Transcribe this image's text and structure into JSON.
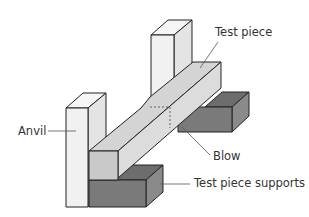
{
  "diagram": {
    "labels": {
      "test_piece": "Test piece",
      "anvil": "Anvil",
      "blow": "Blow",
      "supports": "Test piece supports"
    },
    "colors": {
      "anvil_front": "#f1f1f1",
      "anvil_top": "#f6f6f6",
      "anvil_side": "#e4e4e4",
      "piece_top": "#d4d4d4",
      "piece_side": "#dcdcdc",
      "piece_end": "#c9c9c9",
      "support_front": "#7a7a7a",
      "support_top": "#6d6d6d",
      "support_side": "#8a8a8a",
      "outline": "#222222",
      "leader": "#555555"
    }
  }
}
